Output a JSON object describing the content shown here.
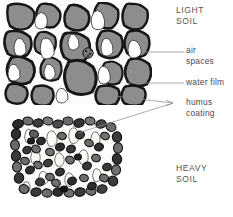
{
  "figure": {
    "title_absent": true,
    "panels": [
      {
        "id": "light-soil-panel",
        "label": "LIGHT\nSOIL",
        "label_line1": "LIGHT",
        "label_line2": "SOIL",
        "description": "Cross-section of light soil showing large rounded gray aggregates separated by white air spaces",
        "bounds": {
          "x": 4,
          "y": 4,
          "width": 146,
          "height": 100
        },
        "particle_fill": "#8d8d8d",
        "particle_outline": "#1c1c1c",
        "void_fill": "#ffffff"
      },
      {
        "id": "heavy-soil-panel",
        "label": "HEAVY\nSOIL",
        "label_line1": "HEAVY",
        "label_line2": "SOIL",
        "description": "Cross-section of heavy soil showing many small dark densely packed particles with humus coating",
        "bounds": {
          "x": 12,
          "y": 118,
          "width": 108,
          "height": 78
        },
        "particle_fill": "#6e6e6e",
        "particle_outline": "#141414",
        "void_fill": "#fdfdfb"
      }
    ],
    "callouts": [
      {
        "id": "air-spaces",
        "line1": "air",
        "line2": "spaces",
        "text": "air spaces",
        "leader_from": {
          "x": 145,
          "y": 52
        },
        "leader_to": {
          "x": 184,
          "y": 52
        }
      },
      {
        "id": "water-film",
        "line1": "water film",
        "line2": "",
        "text": "water film",
        "leader_from": {
          "x": 128,
          "y": 83
        },
        "leader_to": {
          "x": 184,
          "y": 83
        }
      },
      {
        "id": "humus-coating",
        "line1": "humus",
        "line2": "coating",
        "text": "humus coating",
        "leader_to": {
          "x": 173,
          "y": 103
        },
        "leader_from_upper": {
          "x": 105,
          "y": 95
        },
        "leader_from_lower": {
          "x": 78,
          "y": 133
        },
        "arrowhead": true
      }
    ],
    "colors": {
      "background": "#ffffff",
      "text": "#4a4a4a",
      "leader_line": "#8a8a8a",
      "light_particle": "#8d8d8d",
      "dark_particle": "#5c5c5c",
      "outline": "#111111"
    }
  }
}
